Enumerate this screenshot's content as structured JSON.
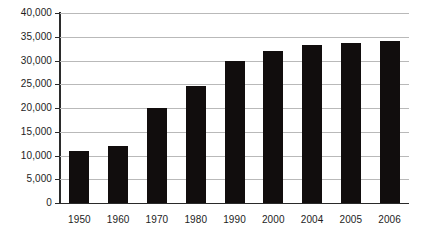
{
  "chart_data": {
    "type": "bar",
    "title": "",
    "subtitle": "",
    "xlabel": "",
    "ylabel": "",
    "categories": [
      "1950",
      "1960",
      "1970",
      "1980",
      "1990",
      "2000",
      "2004",
      "2005",
      "2006"
    ],
    "values": [
      11000,
      12000,
      20000,
      24700,
      29900,
      31900,
      33300,
      33700,
      34200
    ],
    "series": [
      {
        "name": "",
        "values": [
          11000,
          12000,
          20000,
          24700,
          29900,
          31900,
          33300,
          33700,
          34200
        ]
      }
    ],
    "ylim": [
      0,
      40000
    ],
    "y_ticks": [
      0,
      5000,
      10000,
      15000,
      20000,
      25000,
      30000,
      35000,
      40000
    ],
    "y_tick_labels": [
      "0",
      "5,000",
      "10,000",
      "15,000",
      "20,000",
      "25,000",
      "30,000",
      "35,000",
      "40,000"
    ],
    "grid": true,
    "legend": false,
    "legend_position": "none",
    "bar_color": "#110d0d",
    "grid_color": "#b9b9b9",
    "axis_color": "#2b2b2b",
    "background_color": "#ffffff"
  }
}
